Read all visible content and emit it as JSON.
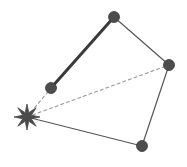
{
  "figure": {
    "canvas": {
      "width": 187,
      "height": 167,
      "background": "#ffffff"
    },
    "colors": {
      "node_fill": "#4d4d4d",
      "node_stroke": "#3c3c3c",
      "edge_solid": "#555555",
      "edge_thick": "#3a3a3a",
      "edge_dashed": "#9a9a9a",
      "star_fill": "#4a4a4a"
    }
  },
  "chart_data": {
    "type": "scatter",
    "xlabel": "",
    "ylabel": "",
    "xlim": [
      0,
      187
    ],
    "ylim": [
      0,
      167
    ],
    "grid": false,
    "legend": "none",
    "nodes": [
      {
        "id": "star",
        "label": "",
        "marker": "star",
        "x": 27,
        "y": 117,
        "size": 13,
        "color": "#4a4a4a"
      },
      {
        "id": "top",
        "label": "",
        "marker": "circle",
        "x": 114,
        "y": 17,
        "size": 5.5,
        "color": "#4d4d4d"
      },
      {
        "id": "left",
        "label": "",
        "marker": "circle",
        "x": 51,
        "y": 88,
        "size": 5.5,
        "color": "#4d4d4d"
      },
      {
        "id": "right",
        "label": "",
        "marker": "circle",
        "x": 169,
        "y": 65,
        "size": 5.5,
        "color": "#4d4d4d"
      },
      {
        "id": "bottom",
        "label": "",
        "marker": "circle",
        "x": 142,
        "y": 146,
        "size": 5.5,
        "color": "#4d4d4d"
      }
    ],
    "edges": [
      {
        "id": "left-top",
        "from": "left",
        "to": "top",
        "style": "solid",
        "width": 3,
        "color": "#3a3a3a"
      },
      {
        "id": "top-right",
        "from": "top",
        "to": "right",
        "style": "solid",
        "width": 1.2,
        "color": "#555555"
      },
      {
        "id": "right-bottom",
        "from": "right",
        "to": "bottom",
        "style": "solid",
        "width": 1.2,
        "color": "#555555"
      },
      {
        "id": "bottom-star",
        "from": "bottom",
        "to": "star",
        "style": "solid",
        "width": 1.2,
        "color": "#555555"
      },
      {
        "id": "star-left",
        "from": "star",
        "to": "left",
        "style": "dashed",
        "width": 1.1,
        "color": "#9a9a9a"
      },
      {
        "id": "star-right",
        "from": "star",
        "to": "right",
        "style": "dashed",
        "width": 1.1,
        "color": "#9a9a9a"
      }
    ]
  }
}
